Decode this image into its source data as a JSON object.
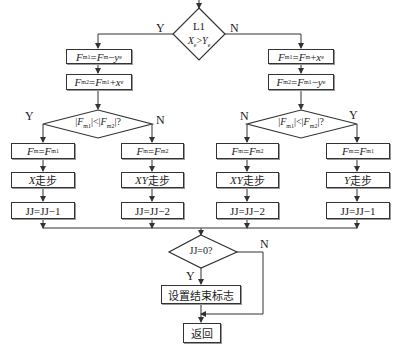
{
  "diagram": {
    "type": "flowchart",
    "start_decision": {
      "line1": "L1",
      "condition": "Xe > Ye",
      "cond_x": "X",
      "cond_x_sub": "e",
      "cond_op": ">",
      "cond_y": "Y",
      "cond_y_sub": "e",
      "yes_label": "Y",
      "no_label": "N"
    },
    "left_branch": {
      "step1": {
        "lhs": "F",
        "lhs_sub": "m1",
        "eq": "=",
        "r1": "F",
        "r1_sub": "m",
        "op": "−",
        "r2": "y",
        "r2_sub": "e",
        "text": "Fm1=Fm−ye"
      },
      "step2": {
        "lhs": "F",
        "lhs_sub": "m2",
        "eq": "=",
        "r1": "F",
        "r1_sub": "m1",
        "op": "+",
        "r2": "x",
        "r2_sub": "e",
        "text": "Fm2=Fm1+xe"
      },
      "decision": {
        "text": "|Fm1|<|Fm2|?",
        "a": "F",
        "a_sub": "m1",
        "b": "F",
        "b_sub": "m2",
        "yes_label": "Y",
        "no_label": "N"
      },
      "yes_path": {
        "assign": {
          "lhs": "F",
          "lhs_sub": "m",
          "rhs": "F",
          "rhs_sub": "m1",
          "text": "Fm=Fm1"
        },
        "step_axis": "X",
        "step_label": "走步",
        "counter": "JJ=JJ−1"
      },
      "no_path": {
        "assign": {
          "lhs": "F",
          "lhs_sub": "m",
          "rhs": "F",
          "rhs_sub": "m2",
          "text": "Fm=Fm2"
        },
        "step_axis": "XY",
        "step_label": "走步",
        "counter": "JJ=JJ−2"
      }
    },
    "right_branch": {
      "step1": {
        "lhs": "F",
        "lhs_sub": "m1",
        "eq": "=",
        "r1": "F",
        "r1_sub": "m",
        "op": "+",
        "r2": "x",
        "r2_sub": "e",
        "text": "Fm1=Fm+xe"
      },
      "step2": {
        "lhs": "F",
        "lhs_sub": "m2",
        "eq": "=",
        "r1": "F",
        "r1_sub": "m1",
        "op": "−",
        "r2": "y",
        "r2_sub": "e",
        "text": "Fm2=Fm1−ye"
      },
      "decision": {
        "text": "|Fm1|<|Fm2|?",
        "a": "F",
        "a_sub": "m1",
        "b": "F",
        "b_sub": "m2",
        "yes_label": "Y",
        "no_label": "N"
      },
      "no_path": {
        "assign": {
          "lhs": "F",
          "lhs_sub": "m",
          "rhs": "F",
          "rhs_sub": "m2",
          "text": "Fm=Fm2"
        },
        "step_axis": "XY",
        "step_label": "走步",
        "counter": "JJ=JJ−2"
      },
      "yes_path": {
        "assign": {
          "lhs": "F",
          "lhs_sub": "m",
          "rhs": "F",
          "rhs_sub": "m1",
          "text": "Fm=Fm1"
        },
        "step_axis": "Y",
        "step_label": "走步",
        "counter": "JJ=JJ−1"
      }
    },
    "end_decision": {
      "text": "JJ=0?",
      "yes_label": "Y",
      "no_label": "N"
    },
    "set_end_flag": "设置结束标志",
    "return": "返回"
  }
}
